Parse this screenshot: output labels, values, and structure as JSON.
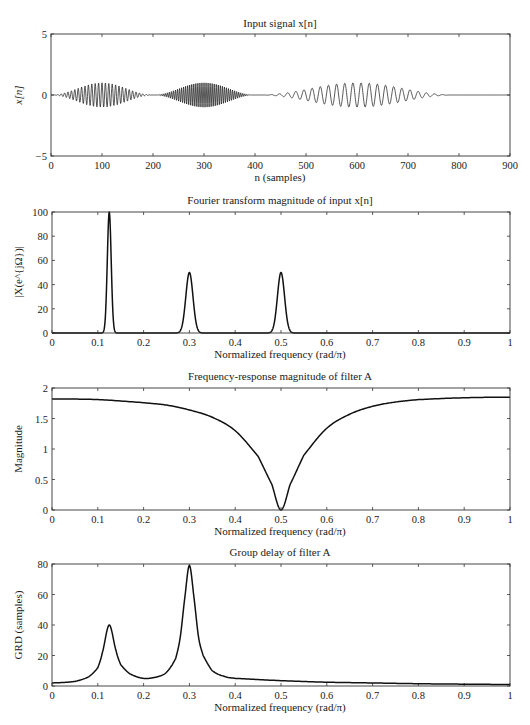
{
  "figure": {
    "caption": "Figure P2.2-?",
    "line_color": "#111111",
    "axis_color": "#333333"
  },
  "chart_data": [
    {
      "id": "input-signal",
      "type": "line",
      "title": "Input signal x[n]",
      "xlabel": "n (samples)",
      "ylabel": "x[n]",
      "xlim": [
        0,
        900
      ],
      "ylim": [
        -5,
        5
      ],
      "xticks": [
        0,
        100,
        200,
        300,
        400,
        500,
        600,
        700,
        800,
        900
      ],
      "yticks": [
        -5,
        0,
        5
      ],
      "grid": false,
      "series": [
        {
          "name": "x[n]",
          "components": [
            {
              "center": 100,
              "start": 0,
              "end": 200,
              "amplitude": 1.0,
              "freq_rad_per_pi": 0.3
            },
            {
              "center": 300,
              "start": 200,
              "end": 400,
              "amplitude": 1.0,
              "freq_rad_per_pi": 0.5
            },
            {
              "center": 600,
              "start": 410,
              "end": 790,
              "amplitude": 1.0,
              "freq_rad_per_pi": 0.125
            }
          ]
        }
      ]
    },
    {
      "id": "ft-magnitude",
      "type": "line",
      "title": "Fourier transform magnitude of input x[n]",
      "xlabel": "Normalized frequency (rad/π)",
      "ylabel": "|X(e^{jΩ})|",
      "xlim": [
        0,
        1
      ],
      "ylim": [
        0,
        100
      ],
      "xticks": [
        0,
        0.1,
        0.2,
        0.3,
        0.4,
        0.5,
        0.6,
        0.7,
        0.8,
        0.9,
        1
      ],
      "yticks": [
        0,
        20,
        40,
        60,
        80,
        100
      ],
      "grid": false,
      "series": [
        {
          "name": "|X|",
          "peaks": [
            {
              "x": 0.125,
              "y": 100,
              "width": 0.006
            },
            {
              "x": 0.3,
              "y": 50,
              "width": 0.011
            },
            {
              "x": 0.5,
              "y": 50,
              "width": 0.011
            }
          ]
        }
      ]
    },
    {
      "id": "filter-magnitude",
      "type": "line",
      "title": "Frequency-response magnitude of filter A",
      "xlabel": "Normalized frequency (rad/π)",
      "ylabel": "Magnitude",
      "xlim": [
        0,
        1
      ],
      "ylim": [
        0,
        2
      ],
      "xticks": [
        0,
        0.1,
        0.2,
        0.3,
        0.4,
        0.5,
        0.6,
        0.7,
        0.8,
        0.9,
        1
      ],
      "yticks": [
        0,
        0.5,
        1,
        1.5,
        2
      ],
      "grid": false,
      "series": [
        {
          "name": "|H|",
          "x": [
            0,
            0.1,
            0.2,
            0.25,
            0.3,
            0.35,
            0.4,
            0.45,
            0.48,
            0.5,
            0.52,
            0.55,
            0.6,
            0.65,
            0.7,
            0.75,
            0.8,
            0.9,
            1.0
          ],
          "y": [
            1.82,
            1.81,
            1.76,
            1.72,
            1.64,
            1.52,
            1.3,
            0.88,
            0.42,
            0.0,
            0.42,
            0.9,
            1.34,
            1.57,
            1.7,
            1.77,
            1.81,
            1.84,
            1.85
          ]
        }
      ]
    },
    {
      "id": "group-delay",
      "type": "line",
      "title": "Group delay of filter A",
      "xlabel": "Normalized frequency (rad/π)",
      "ylabel": "GRD (samples)",
      "xlim": [
        0,
        1
      ],
      "ylim": [
        0,
        80
      ],
      "xticks": [
        0,
        0.1,
        0.2,
        0.3,
        0.4,
        0.5,
        0.6,
        0.7,
        0.8,
        0.9,
        1
      ],
      "yticks": [
        0,
        20,
        40,
        60,
        80
      ],
      "grid": false,
      "series": [
        {
          "name": "GRD",
          "x": [
            0,
            0.05,
            0.08,
            0.1,
            0.11,
            0.125,
            0.14,
            0.15,
            0.17,
            0.2,
            0.23,
            0.25,
            0.27,
            0.28,
            0.29,
            0.3,
            0.31,
            0.32,
            0.33,
            0.35,
            0.38,
            0.4,
            0.5,
            0.6,
            0.7,
            0.8,
            0.9,
            1.0
          ],
          "y": [
            2,
            3,
            6,
            12,
            22,
            40,
            23,
            14,
            8,
            5,
            6,
            9,
            18,
            32,
            58,
            79,
            58,
            32,
            20,
            10,
            6,
            5,
            3.5,
            2.5,
            2,
            1.5,
            1.2,
            1
          ]
        }
      ]
    }
  ]
}
